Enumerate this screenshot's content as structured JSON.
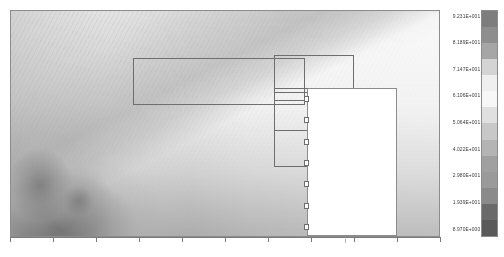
{
  "chart_data": {
    "type": "heatmap",
    "title": "",
    "subtitle": "",
    "xlabel": "",
    "ylabel": "",
    "grid": false,
    "colormap": "grayscale",
    "legend_position": "right",
    "colorbar": {
      "orientation": "vertical",
      "min": 8.97,
      "max": 92.31,
      "tick_labels": [
        "9.231E+001",
        "8.189E+001",
        "7.147E+001",
        "6.106E+001",
        "5.064E+001",
        "4.022E+001",
        "2.980E+001",
        "1.939E+001",
        "8.970E+000"
      ],
      "tick_values": [
        92.31,
        81.89,
        71.47,
        61.06,
        50.64,
        40.22,
        29.8,
        19.39,
        8.97
      ],
      "swatch_colors": [
        "#7d7d7d",
        "#8e8e8e",
        "#a6a6a6",
        "#d4d4d4",
        "#efefef",
        "#f7f7f7",
        "#e0e0e0",
        "#c8c8c8",
        "#b4b4b4",
        "#a0a0a0",
        "#9a9a9a",
        "#8a8a8a",
        "#6a6a6a",
        "#5a5a5a"
      ]
    },
    "x_axis": {
      "ticks": [
        0,
        1,
        2,
        3,
        4,
        5,
        6,
        7,
        8,
        9,
        10
      ],
      "tick_labels": [],
      "range": [
        0,
        10
      ]
    },
    "y_axis": {
      "ticks": [],
      "tick_labels": [],
      "range": [
        0,
        1
      ]
    },
    "refinement_boxes": [
      {
        "id": "level-1-box",
        "x": 0.285,
        "y": 0.79,
        "width": 0.4,
        "height": 0.21
      },
      {
        "id": "level-2-box",
        "x": 0.615,
        "y": 0.655,
        "width": 0.185,
        "height": 0.345
      },
      {
        "id": "level-3-box",
        "x": 0.615,
        "y": 0.64,
        "width": 0.185,
        "height": 0.175
      },
      {
        "id": "level-4-box",
        "x": 0.615,
        "y": 0.8,
        "width": 0.185,
        "height": 0.2
      }
    ],
    "annotation_box": {
      "label": "",
      "marker_count": 7,
      "marker_shape": "open-square"
    }
  },
  "figure": {
    "background_color": "#ffffff",
    "frame_color": "#8c8c8c",
    "box_line_color": "#6e6e6e",
    "axis_color": "#7a7a7a"
  }
}
